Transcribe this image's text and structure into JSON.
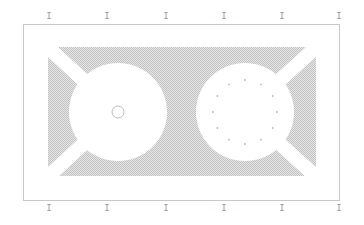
{
  "diagram": {
    "frame": {
      "x": 23,
      "y": 24,
      "width": 316,
      "height": 176,
      "stroke": "#c8c8c8"
    },
    "hatch": {
      "x": 48,
      "y": 47,
      "width": 268,
      "height": 129,
      "color": "#c9c9c9"
    },
    "left_disc": {
      "cx": 118,
      "cy": 112,
      "r": 49
    },
    "left_center_ring": {
      "cx": 118,
      "cy": 112,
      "r": 6,
      "stroke": "#bdbdbd"
    },
    "right_disc": {
      "cx": 245,
      "cy": 112,
      "r": 49
    },
    "right_dot_ring": {
      "cx": 245,
      "cy": 112,
      "r": 32,
      "count": 12,
      "dot_r": 0.9,
      "color": "#b5b5b5"
    },
    "band_width": 14
  },
  "ticks": {
    "glyph": "I",
    "top_y": 12,
    "bottom_y": 204,
    "x_positions": [
      49,
      107,
      166,
      224,
      282,
      339
    ]
  }
}
